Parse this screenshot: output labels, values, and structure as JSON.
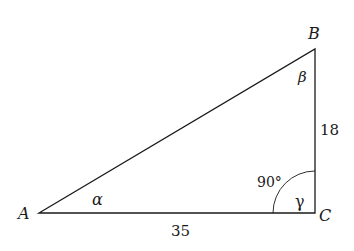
{
  "diagram": {
    "type": "right-triangle",
    "vertices": {
      "A": {
        "label": "A",
        "angle_label": "α"
      },
      "B": {
        "label": "B",
        "angle_label": "β"
      },
      "C": {
        "label": "C",
        "angle_label": "γ",
        "angle_value": "90°"
      }
    },
    "sides": {
      "AC": "35",
      "BC": "18"
    },
    "colors": {
      "stroke": "#1a1a1a",
      "background": "#ffffff"
    }
  }
}
